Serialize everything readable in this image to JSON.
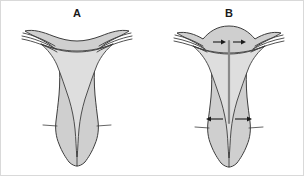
{
  "figure": {
    "background_color": "#ffffff",
    "border_color": "#d9d9d9",
    "organ_fill_color": "#cfcfcf",
    "cavity_fill_color": "#dedede",
    "outline_color": "#3d3d3d",
    "probe_color": "#8a8a8a",
    "arrow_color": "#1a1a1a",
    "width": 304,
    "height": 176
  },
  "panels": [
    {
      "id": "a",
      "label": "A",
      "has_probe": false,
      "arrows": []
    },
    {
      "id": "b",
      "label": "B",
      "has_probe": true,
      "arrows": [
        {
          "name": "fundus-arrow-left",
          "direction": "right"
        },
        {
          "name": "fundus-arrow-right",
          "direction": "right"
        },
        {
          "name": "cervix-arrow-left",
          "direction": "left"
        },
        {
          "name": "cervix-arrow-right",
          "direction": "right"
        }
      ]
    }
  ],
  "icons": {
    "arrow_right": "arrow-right-icon",
    "arrow_left": "arrow-left-icon",
    "probe": "uterine-sound-probe-icon"
  }
}
